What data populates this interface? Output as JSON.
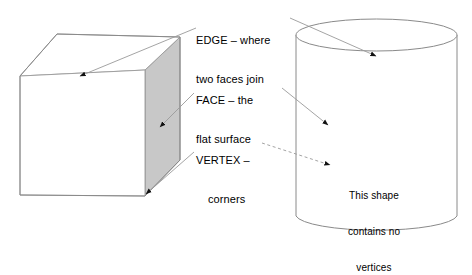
{
  "diagram": {
    "shapes": [
      {
        "name": "cube",
        "description": "Cube drawn in isometric projection with a shaded right face",
        "face_fill": "#c8c8c8",
        "outline_color": "#808080"
      },
      {
        "name": "cylinder",
        "description": "Cylinder drawn with elliptical top and curved base",
        "face_fill": "#ffffff",
        "outline_color": "#808080"
      }
    ],
    "labels": {
      "edge": {
        "line1": "EDGE – where",
        "line2": "two faces join"
      },
      "face": {
        "line1": "FACE – the",
        "line2": "flat surface"
      },
      "vertex": {
        "line1": "VERTEX –",
        "line2": "corners"
      },
      "no_vertices": {
        "line1": "This shape",
        "line2": "contains no",
        "line3": "vertices"
      }
    },
    "leader_lines": [
      {
        "label": "edge",
        "target": "cube-top-front-edge",
        "style": "solid",
        "arrow": true
      },
      {
        "label": "edge",
        "target": "cylinder-top-rim",
        "style": "solid",
        "arrow": true
      },
      {
        "label": "face",
        "target": "cube-right-face",
        "style": "solid",
        "arrow": true
      },
      {
        "label": "face",
        "target": "cylinder-curved-surface",
        "style": "solid",
        "arrow": true
      },
      {
        "label": "vertex",
        "target": "cube-bottom-front-right-corner",
        "style": "solid",
        "arrow": true
      },
      {
        "label": "no_vertices",
        "target": "cylinder-body",
        "style": "dashed",
        "arrow": true
      }
    ]
  }
}
